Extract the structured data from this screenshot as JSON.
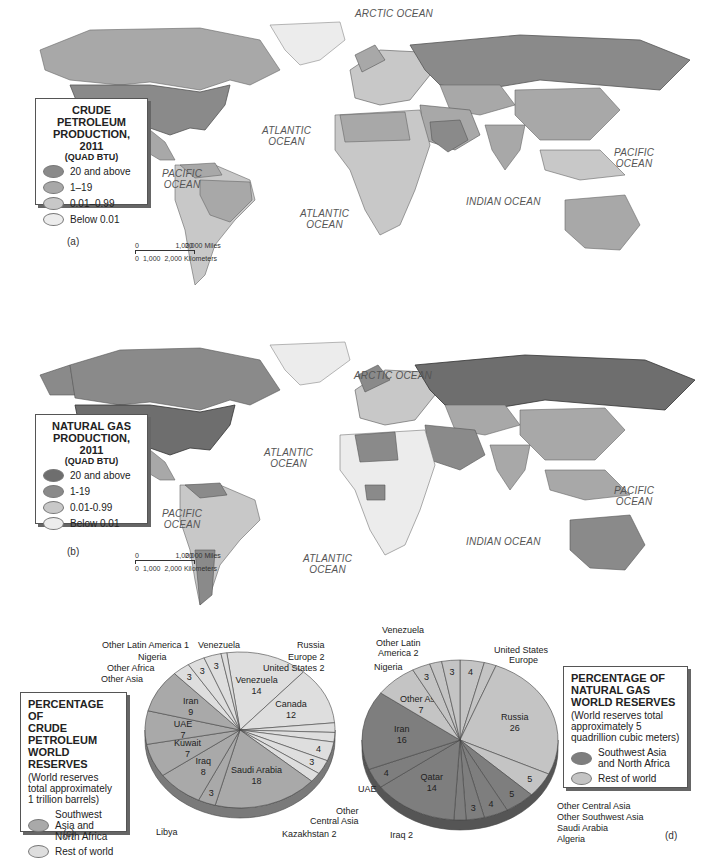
{
  "colors": {
    "tier_high": "#8a8a8a",
    "tier_mid": "#a8a8a8",
    "tier_low": "#c8c8c8",
    "tier_none": "#ececec",
    "swna_oil": "#a9a9a9",
    "rest_oil": "#dedede",
    "swna_gas": "#7e7e7e",
    "rest_gas": "#c4c4c4"
  },
  "map_a": {
    "panel_label": "(a)",
    "legend": {
      "title_line1": "CRUDE PETROLEUM",
      "title_line2": "PRODUCTION, 2011",
      "subtitle": "(QUAD BTU)",
      "items": [
        {
          "label": "20 and above"
        },
        {
          "label": "1–19"
        },
        {
          "label": "0.01–0.99"
        },
        {
          "label": "Below 0.01"
        }
      ]
    },
    "oceans": {
      "arctic": "ARCTIC OCEAN",
      "atlantic_n_1": "ATLANTIC",
      "atlantic_n_2": "OCEAN",
      "atlantic_s_1": "ATLANTIC",
      "atlantic_s_2": "OCEAN",
      "pacific_e_1": "PACIFIC",
      "pacific_e_2": "OCEAN",
      "pacific_w_1": "PACIFIC",
      "pacific_w_2": "OCEAN",
      "indian": "INDIAN OCEAN"
    },
    "scale": {
      "miles": [
        "0",
        "1,000",
        "2,000 Miles"
      ],
      "km": [
        "0",
        "1,000",
        "2,000 Kilometers"
      ]
    }
  },
  "map_b": {
    "panel_label": "(b)",
    "legend": {
      "title_line1": "NATURAL GAS",
      "title_line2": "PRODUCTION, 2011",
      "subtitle": "(QUAD BTU)",
      "items": [
        {
          "label": "20 and above"
        },
        {
          "label": "1-19"
        },
        {
          "label": "0.01-0.99"
        },
        {
          "label": "Below 0.01"
        }
      ]
    },
    "oceans": {
      "arctic": "ARCTIC OCEAN",
      "atlantic_n_1": "ATLANTIC",
      "atlantic_n_2": "OCEAN",
      "atlantic_s_1": "ATLANTIC",
      "atlantic_s_2": "OCEAN",
      "pacific_e_1": "PACIFIC",
      "pacific_e_2": "OCEAN",
      "pacific_w_1": "PACIFIC",
      "pacific_w_2": "OCEAN",
      "indian": "INDIAN OCEAN"
    },
    "scale": {
      "miles": [
        "0",
        "1,000",
        "2,000 Miles"
      ],
      "km": [
        "0",
        "1,000",
        "2,000 Kilometers"
      ]
    }
  },
  "pie_c": {
    "panel_label": "(c)",
    "legend": {
      "title_line1": "PERCENTAGE OF",
      "title_line2": "CRUDE PETROLEUM",
      "title_line3": "WORLD RESERVES",
      "note": "(World reserves total approximately 1 trillion barrels)",
      "items": [
        {
          "label": "Southwest Asia and North Africa"
        },
        {
          "label": "Rest of world"
        }
      ]
    }
  },
  "pie_d": {
    "panel_label": "(d)",
    "legend": {
      "title_line1": "PERCENTAGE OF",
      "title_line2": "NATURAL GAS",
      "title_line3": "WORLD RESERVES",
      "note": "(World reserves total approximately  5 quadrillion cubic meters)",
      "items": [
        {
          "label": "Southwest Asia and North Africa"
        },
        {
          "label": "Rest of world"
        }
      ]
    }
  },
  "chart_data": [
    {
      "type": "pie",
      "title": "PERCENTAGE OF CRUDE PETROLEUM WORLD RESERVES",
      "subtitle": "(World reserves total approximately 1 trillion barrels)",
      "legend": [
        "Southwest Asia and North Africa",
        "Rest of world"
      ],
      "slices": [
        {
          "label": "Venezuela",
          "value": 14,
          "group": "rest"
        },
        {
          "label": "Canada",
          "value": 12,
          "group": "rest"
        },
        {
          "label": "United States",
          "value": 2,
          "group": "rest"
        },
        {
          "label": "Europe",
          "value": 2,
          "group": "rest"
        },
        {
          "label": "Russia",
          "value": 4,
          "group": "rest"
        },
        {
          "label": "Other Central Asia",
          "value": 3,
          "group": "rest"
        },
        {
          "label": "Kazakhstan",
          "value": 2,
          "group": "rest"
        },
        {
          "label": "Saudi Arabia",
          "value": 18,
          "group": "swna"
        },
        {
          "label": "Libya",
          "value": 3,
          "group": "swna"
        },
        {
          "label": "Iraq",
          "value": 8,
          "group": "swna"
        },
        {
          "label": "Kuwait",
          "value": 7,
          "group": "swna"
        },
        {
          "label": "UAE",
          "value": 7,
          "group": "swna"
        },
        {
          "label": "Iran",
          "value": 9,
          "group": "swna"
        },
        {
          "label": "Other Asia",
          "value": 3,
          "group": "rest"
        },
        {
          "label": "Other Africa",
          "value": 3,
          "group": "rest"
        },
        {
          "label": "Nigeria",
          "value": 3,
          "group": "rest"
        },
        {
          "label": "Other Latin America",
          "value": 1,
          "group": "rest"
        }
      ]
    },
    {
      "type": "pie",
      "title": "PERCENTAGE OF NATURAL GAS WORLD RESERVES",
      "subtitle": "(World reserves total approximately 5 quadrillion cubic meters)",
      "legend": [
        "Southwest Asia and North Africa",
        "Rest of world"
      ],
      "slices": [
        {
          "label": "United States",
          "value": 4,
          "group": "rest"
        },
        {
          "label": "Europe",
          "value": 2,
          "group": "rest"
        },
        {
          "label": "Russia",
          "value": 26,
          "group": "rest"
        },
        {
          "label": "Other Central Asia",
          "value": 5,
          "group": "rest"
        },
        {
          "label": "Other Southwest Asia",
          "value": 5,
          "group": "swna"
        },
        {
          "label": "Saudi Arabia",
          "value": 4,
          "group": "swna"
        },
        {
          "label": "Algeria",
          "value": 3,
          "group": "swna"
        },
        {
          "label": "Iraq",
          "value": 2,
          "group": "swna"
        },
        {
          "label": "Qatar",
          "value": 14,
          "group": "swna"
        },
        {
          "label": "UAE",
          "value": 4,
          "group": "swna"
        },
        {
          "label": "Iran",
          "value": 16,
          "group": "swna"
        },
        {
          "label": "Other Asia",
          "value": 7,
          "group": "rest"
        },
        {
          "label": "Nigeria",
          "value": 3,
          "group": "rest"
        },
        {
          "label": "Other Latin America",
          "value": 2,
          "group": "rest"
        },
        {
          "label": "Venezuela",
          "value": 3,
          "group": "rest"
        }
      ]
    }
  ],
  "pie_c_labels": {
    "other_latin_america": "Other Latin America 1",
    "nigeria": "Nigeria",
    "other_africa": "Other Africa",
    "other_asia": "Other Asia",
    "venezuela": "Venezuela",
    "russia": "Russia",
    "europe": "Europe 2",
    "united_states": "United States 2",
    "libya": "Libya",
    "other_central_asia_1": "Other",
    "other_central_asia_2": "Central Asia",
    "kazakhstan": "Kazakhstan 2"
  },
  "pie_d_labels": {
    "venezuela": "Venezuela",
    "other_latin_america_1": "Other Latin",
    "other_latin_america_2": "America 2",
    "nigeria": "Nigeria",
    "united_states": "United States",
    "europe": "Europe",
    "uae": "UAE",
    "iraq": "Iraq 2",
    "other_central_asia": "Other Central Asia",
    "other_southwest_asia": "Other Southwest Asia",
    "saudi_arabia": "Saudi Arabia",
    "algeria": "Algeria"
  }
}
